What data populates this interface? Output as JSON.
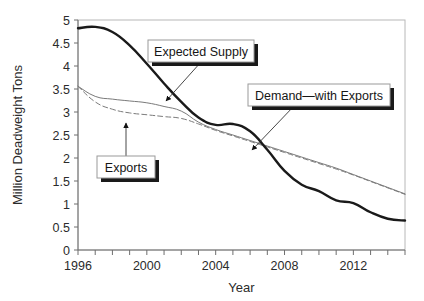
{
  "chart_data": {
    "type": "line",
    "title": "",
    "xlabel": "Year",
    "ylabel": "Million Deadweight Tons",
    "xlim": [
      1996,
      2015
    ],
    "ylim": [
      0,
      5
    ],
    "grid": false,
    "legend_position": "none",
    "xticks": [
      1996,
      1997,
      1998,
      1999,
      2000,
      2001,
      2002,
      2003,
      2004,
      2005,
      2006,
      2007,
      2008,
      2009,
      2010,
      2011,
      2012,
      2013,
      2014,
      2015
    ],
    "xtick_labels": [
      "1996",
      "",
      "",
      "",
      "2000",
      "",
      "",
      "",
      "2004",
      "",
      "",
      "",
      "2008",
      "",
      "",
      "",
      "2012",
      "",
      "",
      ""
    ],
    "yticks": [
      0,
      0.5,
      1,
      1.5,
      2,
      2.5,
      3,
      3.5,
      4,
      4.5,
      5
    ],
    "ytick_labels": [
      "0",
      "0.5",
      "1",
      "1.5",
      "2",
      "2.5",
      "3",
      "3.5",
      "4",
      "4.5",
      "5"
    ],
    "x": [
      1996,
      1997,
      1998,
      1999,
      2000,
      2001,
      2002,
      2003,
      2004,
      2005,
      2006,
      2007,
      2008,
      2009,
      2010,
      2011,
      2012,
      2013,
      2014,
      2015
    ],
    "series": [
      {
        "name": "Expected Supply",
        "style": "solid",
        "color": "#1a1a1a",
        "width": 2.4,
        "values": [
          4.82,
          4.85,
          4.74,
          4.45,
          4.05,
          3.62,
          3.22,
          2.88,
          2.72,
          2.74,
          2.58,
          2.18,
          1.72,
          1.42,
          1.28,
          1.08,
          1.02,
          0.82,
          0.68,
          0.64
        ]
      },
      {
        "name": "Demand—with Exports",
        "style": "solid",
        "color": "#7a7a7a",
        "width": 1.0,
        "values": [
          3.56,
          3.34,
          3.28,
          3.24,
          3.2,
          3.12,
          3.02,
          2.78,
          2.62,
          2.5,
          2.38,
          2.26,
          2.14,
          2.02,
          1.9,
          1.78,
          1.64,
          1.5,
          1.36,
          1.22
        ]
      },
      {
        "name": "Exports",
        "style": "dashed",
        "color": "#7a7a7a",
        "width": 1.0,
        "values": [
          3.56,
          3.22,
          3.06,
          2.98,
          2.94,
          2.9,
          2.86,
          2.74,
          2.6,
          2.48,
          2.36,
          2.24,
          2.12,
          2.0,
          1.88,
          1.76,
          1.63,
          1.49,
          1.35,
          1.21
        ]
      }
    ],
    "annotations": [
      {
        "label": "Expected Supply",
        "box": {
          "x": 148,
          "y": 40,
          "w": 106,
          "h": 22
        },
        "arrow_from": {
          "x": 201,
          "y": 62
        },
        "arrow_to": {
          "x": 166,
          "y": 101
        }
      },
      {
        "label": "Exports",
        "box": {
          "x": 97,
          "y": 156,
          "w": 58,
          "h": 22
        },
        "arrow_from": {
          "x": 126,
          "y": 156
        },
        "arrow_to": {
          "x": 126,
          "y": 123
        }
      },
      {
        "label": "Demand—with Exports",
        "box": {
          "x": 248,
          "y": 84,
          "w": 142,
          "h": 22
        },
        "arrow_from": {
          "x": 294,
          "y": 106
        },
        "arrow_to": {
          "x": 252,
          "y": 150
        }
      }
    ]
  },
  "colors": {
    "supply_line": "#1a1a1a",
    "demand_line": "#7a7a7a",
    "exports_line": "#7a7a7a",
    "axis": "#6e6e6e",
    "plot_border": "#b8b8b8",
    "callout_fill": "#ffffff",
    "callout_border": "#9a9a9a",
    "callout_shadow": "#1a1a1a",
    "background": "#ffffff"
  }
}
